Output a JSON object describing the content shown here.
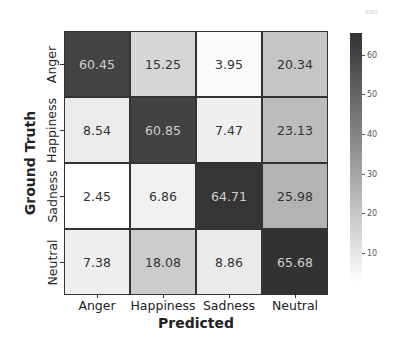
{
  "chart_data": {
    "type": "heatmap",
    "title": "",
    "xlabel": "Predicted",
    "ylabel": "Ground Truth",
    "x_categories": [
      "Anger",
      "Happiness",
      "Sadness",
      "Neutral"
    ],
    "y_categories": [
      "Anger",
      "Happiness",
      "Sadness",
      "Neutral"
    ],
    "values": [
      [
        60.45,
        15.25,
        3.95,
        20.34
      ],
      [
        8.54,
        60.85,
        7.47,
        23.13
      ],
      [
        2.45,
        6.86,
        64.71,
        25.98
      ],
      [
        7.38,
        18.08,
        8.86,
        65.68
      ]
    ],
    "value_labels": [
      [
        "60.45",
        "15.25",
        "3.95",
        "20.34"
      ],
      [
        "8.54",
        "60.85",
        "7.47",
        "23.13"
      ],
      [
        "2.45",
        "6.86",
        "64.71",
        "25.98"
      ],
      [
        "7.38",
        "18.08",
        "8.86",
        "65.68"
      ]
    ],
    "colormap": "Greys",
    "colorbar": {
      "ticks": [
        10,
        20,
        30,
        40,
        50,
        60
      ],
      "tick_labels": [
        "10",
        "20",
        "30",
        "40",
        "50",
        "60"
      ],
      "range": [
        2.45,
        65.68
      ]
    }
  },
  "labels": {
    "xlabel": "Predicted",
    "ylabel": "Ground Truth",
    "corner_mark": "RBG"
  }
}
